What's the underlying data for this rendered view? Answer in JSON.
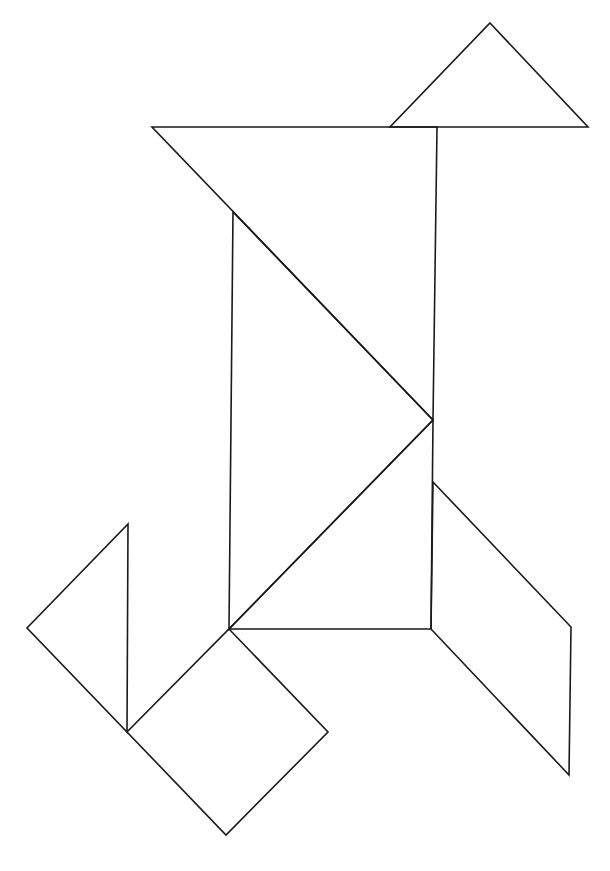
{
  "stroke_color": "#1a1a1a",
  "background": "#ffffff",
  "pieces": [
    {
      "name": "head-triangle",
      "kind": "small-triangle"
    },
    {
      "name": "large-top-triangle",
      "kind": "large-triangle"
    },
    {
      "name": "large-middle-triangle",
      "kind": "large-triangle"
    },
    {
      "name": "body-lower-triangle",
      "kind": "medium-triangle"
    },
    {
      "name": "leg-square",
      "kind": "square"
    },
    {
      "name": "tail-triangle",
      "kind": "small-triangle"
    },
    {
      "name": "leg-parallelogram",
      "kind": "parallelogram"
    }
  ]
}
